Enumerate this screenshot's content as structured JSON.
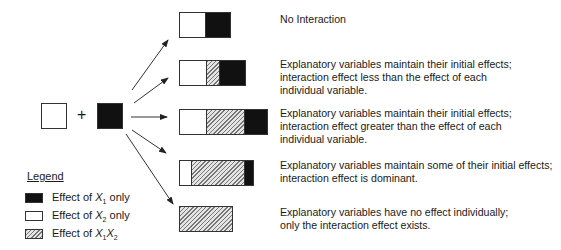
{
  "diagram": {
    "inputs": {
      "left_square": "Effect of X2 only",
      "operator": "+",
      "right_square": "Effect of X1 only"
    },
    "rows": [
      {
        "segments": [
          {
            "type": "x2",
            "width": 25
          },
          {
            "type": "x1",
            "width": 26
          }
        ],
        "description": [
          "No Interaction"
        ]
      },
      {
        "segments": [
          {
            "type": "x2",
            "width": 26
          },
          {
            "type": "x1x2",
            "width": 13
          },
          {
            "type": "x1",
            "width": 27
          }
        ],
        "description": [
          "Explanatory variables maintain their initial effects;",
          "interaction effect less than the effect of each",
          "individual variable."
        ]
      },
      {
        "segments": [
          {
            "type": "x2",
            "width": 26
          },
          {
            "type": "x1x2",
            "width": 38
          },
          {
            "type": "x1",
            "width": 24
          }
        ],
        "description": [
          "Explanatory variables maintain their initial effects;",
          "interaction effect greater than the effect of each",
          "individual variable."
        ]
      },
      {
        "segments": [
          {
            "type": "x2",
            "width": 11
          },
          {
            "type": "x1x2",
            "width": 53
          },
          {
            "type": "x1",
            "width": 10
          }
        ],
        "description": [
          "Explanatory variables maintain some of their initial effects;",
          "interaction effect is dominant."
        ]
      },
      {
        "segments": [
          {
            "type": "x1x2",
            "width": 53
          }
        ],
        "description": [
          "Explanatory variables have no effect individually;",
          "only the interaction effect exists."
        ]
      }
    ],
    "legend": {
      "title": "Legend",
      "items": [
        {
          "swatch": "black",
          "label_prefix": "Effect of ",
          "var": "X",
          "sub": "1",
          "suffix": " only"
        },
        {
          "swatch": "white",
          "label_prefix": "Effect of ",
          "var": "X",
          "sub": "2",
          "suffix": " only"
        },
        {
          "swatch": "hatch",
          "label_prefix": "Effect of ",
          "var": "X",
          "sub": "1",
          "var2": "X",
          "sub2": "2",
          "suffix": ""
        }
      ]
    },
    "colors": {
      "x1": "#111111",
      "x2": "#ffffff",
      "x1x2": "hatched gray",
      "outline": "#333333"
    }
  }
}
